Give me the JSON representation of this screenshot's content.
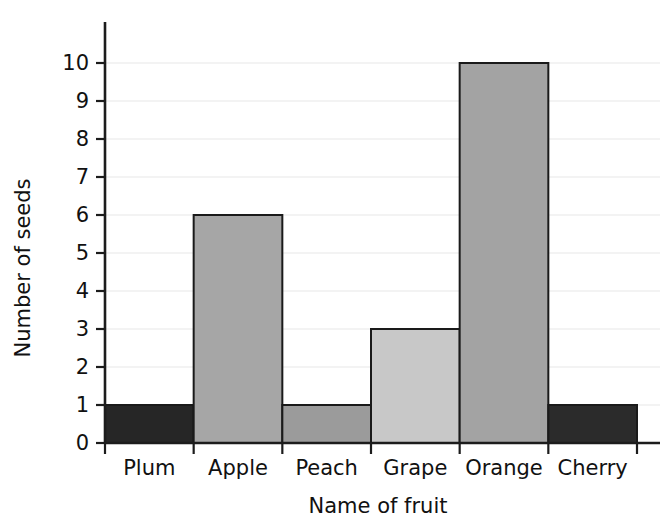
{
  "chart_data": {
    "type": "bar",
    "title": "",
    "xlabel": "Name of fruit",
    "ylabel": "Number of seeds",
    "categories": [
      "Plum",
      "Apple",
      "Peach",
      "Grape",
      "Orange",
      "Cherry"
    ],
    "values": [
      1,
      6,
      1,
      3,
      10,
      1
    ],
    "bar_colors": [
      "#262626",
      "#a6a6a6",
      "#9b9b9b",
      "#c8c8c8",
      "#a3a3a3",
      "#2b2b2b"
    ],
    "bar_outline_color": "#1a1a1a",
    "ylim": [
      0,
      10
    ],
    "y_ticks": [
      0,
      1,
      2,
      3,
      4,
      5,
      6,
      7,
      8,
      9,
      10
    ],
    "y_tick_labels": [
      "0",
      "1",
      "2",
      "3",
      "4",
      "5",
      "6",
      "7",
      "8",
      "9",
      "10"
    ],
    "grid": true,
    "gridline_color": "#efefef",
    "legend": null,
    "legend_position": "none",
    "axis_color": "#1c1c1c",
    "background_color": "#ffffff",
    "series": [
      {
        "name": "Number of seeds",
        "values": [
          1,
          6,
          1,
          3,
          10,
          1
        ]
      }
    ],
    "points": [
      {
        "category": "Plum",
        "value": 1,
        "color": "#262626"
      },
      {
        "category": "Apple",
        "value": 6,
        "color": "#a6a6a6"
      },
      {
        "category": "Peach",
        "value": 1,
        "color": "#9b9b9b"
      },
      {
        "category": "Grape",
        "value": 3,
        "color": "#c8c8c8"
      },
      {
        "category": "Orange",
        "value": 10,
        "color": "#a3a3a3"
      },
      {
        "category": "Cherry",
        "value": 1,
        "color": "#2b2b2b"
      }
    ]
  }
}
